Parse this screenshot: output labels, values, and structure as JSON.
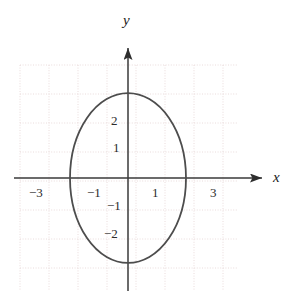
{
  "figure": {
    "width": 293,
    "height": 308,
    "background": "#ffffff"
  },
  "axes": {
    "x_label": "x",
    "y_label": "y",
    "x_axis_color": "#3a3a3a",
    "y_axis_color": "#3a3a3a",
    "origin_px": {
      "x": 128,
      "y": 178
    },
    "unit_px": 29,
    "x_arrow_tip_px": 265,
    "y_arrow_tip_px": 44,
    "x_axis_start_px": 14,
    "y_axis_end_px": 291
  },
  "grid": {
    "color": "#e8d8d8",
    "style": "dotted",
    "left_px": 20,
    "right_px": 238,
    "top_px": 65,
    "bottom_px": 291,
    "spacing_px": 29,
    "visible": true
  },
  "tick_labels": {
    "x": [
      {
        "value": -3,
        "text": "−3"
      },
      {
        "value": -1,
        "text": "−1"
      },
      {
        "value": 1,
        "text": "1"
      },
      {
        "value": 3,
        "text": "3"
      }
    ],
    "y": [
      {
        "value": 2,
        "text": "2"
      },
      {
        "value": 1,
        "text": "1"
      },
      {
        "value": -1,
        "text": "−1"
      },
      {
        "value": -2,
        "text": "−2"
      }
    ]
  },
  "chart_data": {
    "type": "line",
    "title": "",
    "xlabel": "x",
    "ylabel": "y",
    "xlim": [
      -3.7,
      3.8
    ],
    "ylim": [
      -3.9,
      3.9
    ],
    "grid": true,
    "legend": "none",
    "xticks": [
      -3,
      -1,
      1,
      3
    ],
    "yticks": [
      2,
      1,
      -1,
      -2
    ],
    "series": [
      {
        "name": "ellipse",
        "shape": "ellipse",
        "center": [
          0,
          0
        ],
        "semi_axis_x": 2.0,
        "semi_axis_y": 2.93,
        "equation": "x^2/4 + y^2/8.6 = 1",
        "stroke": "#4d4d4d",
        "stroke_width": 1.8,
        "fill": "none",
        "x_intercepts": [
          -2,
          2
        ],
        "y_intercepts": [
          -2.93,
          2.93
        ]
      }
    ]
  },
  "curve_style": {
    "color": "#4d4d4d",
    "width": 1.8
  }
}
